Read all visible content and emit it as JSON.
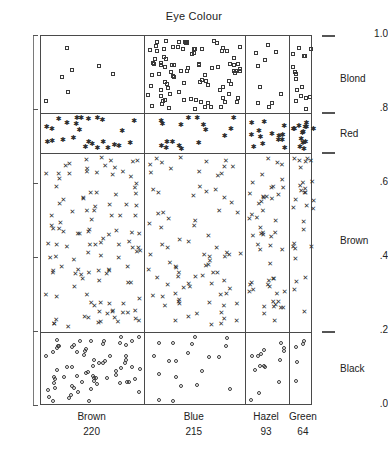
{
  "chart_data": {
    "type": "scatter",
    "title": "Eye Colour",
    "xlabel": "",
    "ylabel": "",
    "ylim": [
      0.0,
      1.0
    ],
    "grid": false,
    "legend_position": "right",
    "y_ticks": [
      {
        "value": 1.0,
        "label": "1.0"
      },
      {
        "value": 0.8,
        "label": ".8"
      },
      {
        "value": 0.6,
        "label": ".6"
      },
      {
        "value": 0.4,
        "label": ".4"
      },
      {
        "value": 0.2,
        "label": ".2"
      },
      {
        "value": 0.0,
        "label": ".0"
      }
    ],
    "columns": [
      {
        "label": "Brown",
        "count": "220",
        "count_value": 220,
        "width_fraction": 0.3797
      },
      {
        "label": "Blue",
        "count": "215",
        "count_value": 215,
        "width_fraction": 0.3711
      },
      {
        "label": "Hazel",
        "count": "93",
        "count_value": 93,
        "width_fraction": 0.1605
      },
      {
        "label": "Green",
        "count": "64",
        "count_value": 64,
        "width_fraction": 0.1105
      }
    ],
    "bands": [
      {
        "label": "Blond",
        "marker": "open-square",
        "y_top": 1.0,
        "y_bottom": 0.792,
        "tick_value": 1.0
      },
      {
        "label": "Red",
        "marker": "asterisk",
        "y_top": 0.792,
        "y_bottom": 0.684,
        "tick_value": 0.792
      },
      {
        "label": "Brown",
        "marker": "cross",
        "y_top": 0.684,
        "y_bottom": 0.2,
        "tick_value": 0.684
      },
      {
        "label": "Black",
        "marker": "open-circle",
        "y_top": 0.2,
        "y_bottom": 0.0,
        "tick_value": 0.2
      }
    ],
    "band_ticks_right": [
      1.0,
      0.792,
      0.684,
      0.2
    ],
    "series": [
      {
        "name": "Blond",
        "marker": "open-square",
        "counts_by_column": [
          7,
          94,
          10,
          16
        ],
        "total": 127
      },
      {
        "name": "Red",
        "marker": "asterisk",
        "counts_by_column": [
          26,
          17,
          14,
          14
        ],
        "total": 71
      },
      {
        "name": "Brown",
        "marker": "cross",
        "counts_by_column": [
          119,
          84,
          54,
          29
        ],
        "total": 286
      },
      {
        "name": "Black",
        "marker": "open-circle",
        "counts_by_column": [
          68,
          20,
          15,
          5
        ],
        "total": 108
      }
    ]
  },
  "axis": {
    "y_label_top": "1.0",
    "y_label_08": ".8",
    "y_label_06": ".6",
    "y_label_04": ".4",
    "y_label_02": ".2",
    "y_label_00": ".0"
  },
  "right_labels": {
    "blond": "Blond",
    "red": "Red",
    "brown": "Brown",
    "black": "Black"
  },
  "bottom_labels": {
    "brown": "Brown",
    "brown_count": "220",
    "blue": "Blue",
    "blue_count": "215",
    "hazel": "Hazel",
    "hazel_count": "93",
    "green": "Green",
    "green_count": "64"
  },
  "colors": {
    "frame": "#4a4a4a",
    "marker": "#2b2b2b",
    "text": "#222222",
    "background": "#ffffff"
  }
}
